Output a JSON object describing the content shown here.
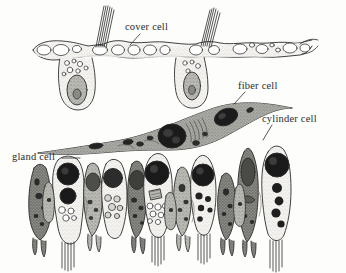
{
  "figure": {
    "background_color": "#fdfdfc",
    "ink_color": "#2b2b2b",
    "style": "grayscale pen-and-ink scientific illustration"
  },
  "labels": [
    {
      "id": "cover",
      "text": "cover cell",
      "leader": "down-left"
    },
    {
      "id": "fiber",
      "text": "fiber cell",
      "leader": "down-left"
    },
    {
      "id": "cylinder",
      "text": "cylinder cell",
      "leader": "down-left"
    },
    {
      "id": "gland",
      "text": "gland cell",
      "leader": "right"
    }
  ],
  "structures": {
    "cover_cell_layer": {
      "name": "cover cell",
      "description": "upper epithelial sheet with vacuoles and two cell bodies bearing nuclei",
      "cilia_bundles": 2,
      "fill": "#f3f1ee"
    },
    "fiber_cell": {
      "name": "fiber cell",
      "description": "elongated spindle-shaped cell spanning the middle of the field",
      "nuclei": 3,
      "fill": "#9a9a95"
    },
    "gland_cells": {
      "name": "gland cell",
      "description": "dark stippled columnar secretory cells",
      "count": 7,
      "fill": "#8d8d88"
    },
    "cylinder_cells": {
      "name": "cylinder cell",
      "description": "pale columnar cells with large dark nuclei and basal rootlet bundles",
      "count": 5,
      "fill": "#efede9"
    }
  },
  "colors": {
    "ink": "#2b2b2b",
    "dark_nucleus": "#1d1d1d",
    "mid_gray": "#8d8d88",
    "light_gray": "#efede9",
    "background": "#fdfdfc"
  }
}
